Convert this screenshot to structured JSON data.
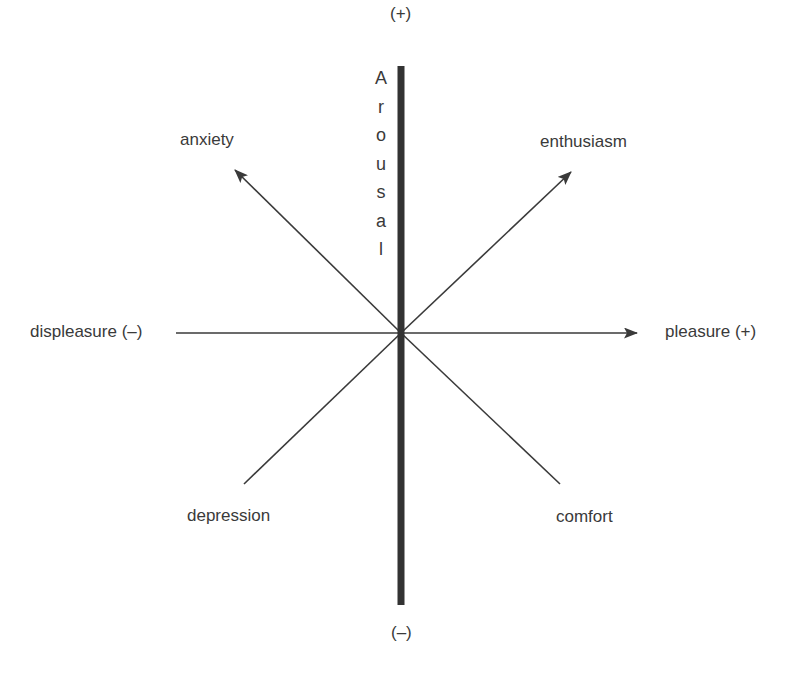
{
  "diagram": {
    "type": "circumplex-model-of-affect",
    "vertical_axis": {
      "label": "Arousal",
      "letters": [
        "A",
        "r",
        "o",
        "u",
        "s",
        "a",
        "l"
      ],
      "top_label": "(+)",
      "bottom_label": "(–)"
    },
    "horizontal_axis": {
      "left_label": "displeasure (–)",
      "right_label": "pleasure (+)"
    },
    "diagonals": {
      "upper_left": "anxiety",
      "upper_right": "enthusiasm",
      "lower_left": "depression",
      "lower_right": "comfort"
    },
    "colors": {
      "line": "#3a3a3a",
      "axis": "#333333",
      "text": "#3a3a3a",
      "background": "#ffffff"
    }
  }
}
